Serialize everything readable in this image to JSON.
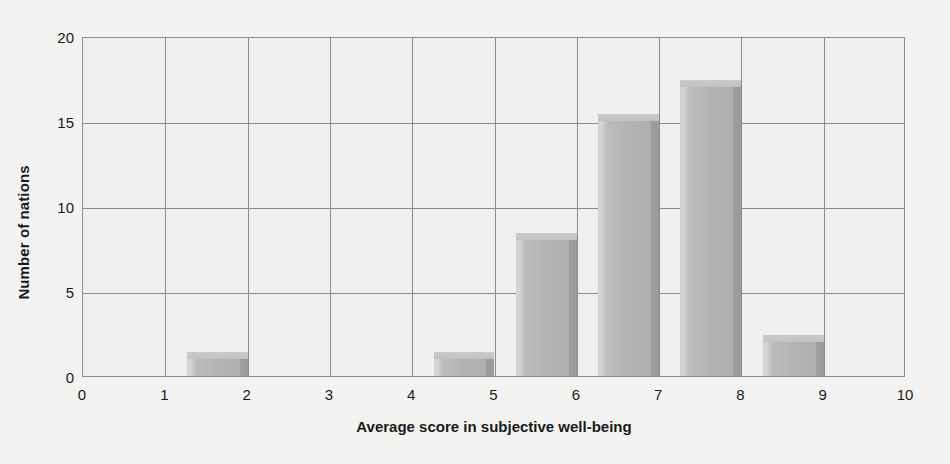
{
  "chart_data": {
    "type": "bar",
    "title": "",
    "subtitle": "",
    "xlabel": "Average score in subjective well-being",
    "ylabel": "Number of nations",
    "xlim": [
      0,
      10
    ],
    "ylim": [
      0,
      20
    ],
    "xticks": [
      "0",
      "1",
      "2",
      "3",
      "4",
      "5",
      "6",
      "7",
      "8",
      "9",
      "10"
    ],
    "yticks": [
      "0",
      "5",
      "10",
      "15",
      "20"
    ],
    "grid": true,
    "legend": null,
    "bin_width": 1,
    "categories": [
      "0-1",
      "1-2",
      "2-3",
      "3-4",
      "4-5",
      "5-6",
      "6-7",
      "7-8",
      "8-9",
      "9-10"
    ],
    "bin_starts": [
      0,
      1,
      2,
      3,
      4,
      5,
      6,
      7,
      8,
      9
    ],
    "values": [
      0,
      1,
      0,
      0,
      1,
      8,
      15,
      17,
      2,
      0
    ],
    "series": [
      {
        "name": "Number of nations",
        "values": [
          0,
          1,
          0,
          0,
          1,
          8,
          15,
          17,
          2,
          0
        ]
      }
    ],
    "style": "3d-bar",
    "colors": {
      "bar_face": "#b4b4b2",
      "bar_side": "#9c9c9a",
      "bar_top": "#c6c6c4",
      "grid": "#8c8c8c",
      "plot_background": "#e8e8e6",
      "figure_background": "#eeeeec",
      "text": "#1a1a1a"
    }
  }
}
